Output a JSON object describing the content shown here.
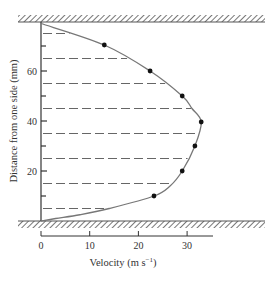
{
  "chart_data": {
    "type": "scatter",
    "title": "",
    "xlabel": "Velocity (m s⁻¹)",
    "xlabel_main": "Velocity (m s",
    "xlabel_sup": "−1",
    "xlabel_close": ")",
    "ylabel": "Distance from one side (mm)",
    "xlim": [
      0,
      35
    ],
    "ylim": [
      0,
      79
    ],
    "x_ticks": [
      0,
      10,
      20,
      30
    ],
    "x_tick_labels": [
      "0",
      "10",
      "20",
      "30"
    ],
    "y_major_ticks": [
      20,
      40,
      60
    ],
    "y_tick_labels": [
      "20",
      "40",
      "60"
    ],
    "y_minor_ticks": [
      10,
      30,
      50,
      70
    ],
    "grid": false,
    "legend": null,
    "walls": {
      "top_mm": 79,
      "bottom_mm": 0,
      "style": "hatched"
    },
    "dashed_reference_lines_mm": [
      5,
      15,
      25,
      35,
      45,
      55,
      65,
      75
    ],
    "series": [
      {
        "name": "Measured velocity",
        "kind": "points",
        "marker": "filled-circle",
        "color": "#111111",
        "points": [
          {
            "velocity": 13.0,
            "distance": 70.4
          },
          {
            "velocity": 22.4,
            "distance": 60.0
          },
          {
            "velocity": 29.0,
            "distance": 50.0
          },
          {
            "velocity": 32.9,
            "distance": 39.6
          },
          {
            "velocity": 31.6,
            "distance": 30.0
          },
          {
            "velocity": 29.0,
            "distance": 20.0
          },
          {
            "velocity": 23.2,
            "distance": 10.0
          }
        ]
      },
      {
        "name": "Fitted velocity profile",
        "kind": "curve",
        "color": "#777777",
        "description": "Smooth profile from zero velocity at bottom wall (0 mm) to maximum ~33 m/s near 40 mm, back to zero at top wall (79 mm)",
        "points": [
          {
            "velocity": 0.0,
            "distance": 0.0
          },
          {
            "velocity": 3.0,
            "distance": 1.0
          },
          {
            "velocity": 8.0,
            "distance": 2.5
          },
          {
            "velocity": 14.0,
            "distance": 5.0
          },
          {
            "velocity": 23.2,
            "distance": 10.0
          },
          {
            "velocity": 26.5,
            "distance": 14.0
          },
          {
            "velocity": 29.0,
            "distance": 20.0
          },
          {
            "velocity": 31.6,
            "distance": 30.0
          },
          {
            "velocity": 32.9,
            "distance": 39.6
          },
          {
            "velocity": 31.0,
            "distance": 45.0
          },
          {
            "velocity": 29.0,
            "distance": 50.0
          },
          {
            "velocity": 22.4,
            "distance": 60.0
          },
          {
            "velocity": 13.0,
            "distance": 70.4
          },
          {
            "velocity": 0.0,
            "distance": 79.0
          }
        ]
      }
    ]
  },
  "colors": {
    "axis": "#333333",
    "dash": "#666666",
    "curve": "#777777",
    "point": "#111111",
    "hatch": "#555555"
  }
}
